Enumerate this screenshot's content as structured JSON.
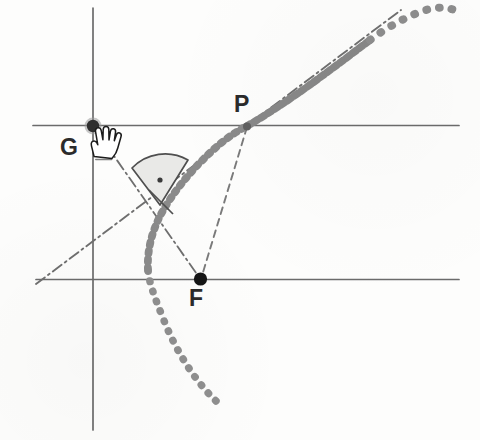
{
  "figure": {
    "background_color": "#fdfdfc",
    "labels": {
      "G": "G",
      "P": "P",
      "F": "F"
    },
    "points": [
      {
        "name": "G",
        "label": "G",
        "x": 93,
        "y": 126,
        "marker": "filled-dot",
        "radius": 6.5,
        "color": "#3a3a3a"
      },
      {
        "name": "P",
        "label": "P",
        "x": 247,
        "y": 126,
        "marker": "small-dot",
        "radius": 3.5,
        "color": "#5a5a5a"
      },
      {
        "name": "F",
        "label": "F",
        "x": 200,
        "y": 279,
        "marker": "filled-dot",
        "radius": 6.5,
        "color": "#1f1f1f"
      }
    ],
    "axes": {
      "vertical_line": {
        "x": 93,
        "y1": 8,
        "y2": 430,
        "color": "#6b6b6b",
        "width": 1.6
      },
      "horizontal_upper": {
        "y": 125,
        "x1": 33,
        "x2": 459,
        "color": "#6b6b6b",
        "width": 1.6
      },
      "horizontal_lower": {
        "y": 279,
        "x1": 36,
        "x2": 459,
        "color": "#6b6b6b",
        "width": 1.6
      }
    },
    "curve": {
      "name": "parabola",
      "style": "dotted-thick",
      "color": "#8c8c8c",
      "focus": "F",
      "vertex_x": 148,
      "vertex_y": 270,
      "end_upper": {
        "x": 459,
        "y": 13
      },
      "end_lower": {
        "x": 216,
        "y": 401
      }
    },
    "lines": [
      {
        "name": "tangent-line",
        "style": "dash-dot",
        "color": "#6f6f6f",
        "x1": 36,
        "y1": 284,
        "x2": 401,
        "y2": 10
      },
      {
        "name": "segment-G-to-F",
        "style": "dash-dot",
        "color": "#6f6f6f",
        "x1": 93,
        "y1": 126,
        "x2": 200,
        "y2": 279
      },
      {
        "name": "segment-P-to-F",
        "style": "dashed",
        "color": "#7a7a7a",
        "x1": 247,
        "y1": 126,
        "x2": 200,
        "y2": 279
      }
    ],
    "angle_marker": {
      "name": "right-angle-sector",
      "apex_x": 160,
      "apex_y": 205,
      "radius": 46,
      "fill": "#e9e9e7",
      "stroke": "#4f4f4f",
      "has_center_dot": true,
      "dot_color": "#3a3a3a"
    },
    "cursor": {
      "name": "hand-cursor",
      "x": 94,
      "y": 128,
      "fill": "#ffffff",
      "stroke": "#1c1c1c"
    }
  }
}
